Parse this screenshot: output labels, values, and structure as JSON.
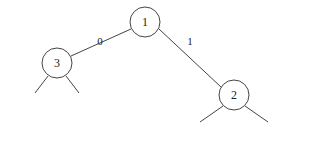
{
  "diagram": {
    "type": "binary-tree",
    "nodes": [
      {
        "id": "root",
        "label": "1",
        "cx": 145,
        "cy": 24,
        "r": 15
      },
      {
        "id": "left",
        "label": "3",
        "cx": 57,
        "cy": 63,
        "r": 15
      },
      {
        "id": "right",
        "label": "2",
        "cx": 234,
        "cy": 95,
        "r": 15
      },
      {
        "id": "right-left",
        "label": "4",
        "cx": 189,
        "cy": 131,
        "r": 15
      },
      {
        "id": "right-right",
        "label": "4",
        "cx": 279,
        "cy": 131,
        "r": 15
      }
    ],
    "leaves": [
      {
        "label": "0001",
        "x": 16,
        "y": 93,
        "w": 36,
        "h": 18
      },
      {
        "label": "0011",
        "x": 60,
        "y": 93,
        "w": 36,
        "h": 18
      },
      {
        "label": "1000",
        "x": 148,
        "y": 132,
        "w": 36,
        "h": 18
      },
      {
        "label": "1001",
        "x": 193,
        "y": 132,
        "w": 36,
        "h": 18
      },
      {
        "label": "1100",
        "x": 238,
        "y": 132,
        "w": 36,
        "h": 18
      },
      {
        "label": "1101",
        "x": 284,
        "y": 132,
        "w": 36,
        "h": 18
      }
    ],
    "edge_labels": [
      {
        "label": "0",
        "x": 99,
        "y": 44
      },
      {
        "label": "1",
        "x": 188,
        "y": 44
      }
    ]
  }
}
